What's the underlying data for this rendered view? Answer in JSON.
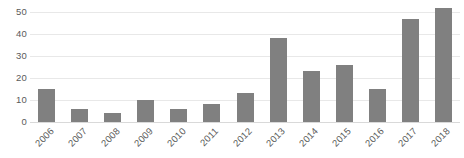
{
  "chart_data": {
    "type": "bar",
    "title": "",
    "subtitle": "",
    "xlabel": "",
    "ylabel": "",
    "categories": [
      "2006",
      "2007",
      "2008",
      "2009",
      "2010",
      "2011",
      "2012",
      "2013",
      "2014",
      "2015",
      "2016",
      "2017",
      "2018"
    ],
    "values": [
      15,
      6,
      4,
      10,
      6,
      8,
      13,
      38,
      23,
      26,
      15,
      47,
      52
    ],
    "ylim": [
      0,
      50
    ],
    "yticks": [
      0,
      10,
      20,
      30,
      40,
      50
    ],
    "ytick_labels": [
      "0",
      "10",
      "20",
      "30",
      "40",
      "50"
    ],
    "grid": true,
    "grid_axis": "y",
    "legend": false,
    "legend_position": "none",
    "annotations": [],
    "colors": {
      "bar": "#808080",
      "gridline": "#e8e8e8",
      "baseline": "#d9d9d9",
      "tick_text": "#5a5a5a",
      "background": "#ffffff"
    },
    "xtick_rotation": -45
  }
}
